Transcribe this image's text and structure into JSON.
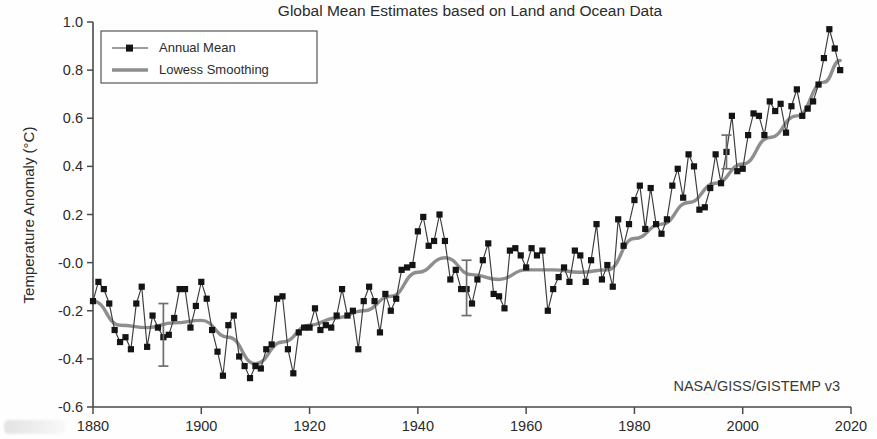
{
  "chart_data": {
    "type": "line",
    "title": "Global Mean Estimates based on Land and Ocean Data",
    "xlabel": "",
    "ylabel": "Temperature Anomaly (°C)",
    "xlim": [
      1880,
      2020
    ],
    "ylim": [
      -0.6,
      1.0
    ],
    "xticks": [
      "1880",
      "1900",
      "1920",
      "1940",
      "1960",
      "1980",
      "2000",
      "2020"
    ],
    "yticks": [
      "1.0",
      "0.8",
      "0.6",
      "0.4",
      "0.2",
      "-0.0",
      "-0.2",
      "-0.4",
      "-0.6"
    ],
    "grid": false,
    "legend_position": "top-left",
    "annotation": "NASA/GISS/GISTEMP v3",
    "series": [
      {
        "name": "Annual Mean",
        "marker": "square",
        "color": "#141414",
        "x": [
          1880,
          1881,
          1882,
          1883,
          1884,
          1885,
          1886,
          1887,
          1888,
          1889,
          1890,
          1891,
          1892,
          1893,
          1894,
          1895,
          1896,
          1897,
          1898,
          1899,
          1900,
          1901,
          1902,
          1903,
          1904,
          1905,
          1906,
          1907,
          1908,
          1909,
          1910,
          1911,
          1912,
          1913,
          1914,
          1915,
          1916,
          1917,
          1918,
          1919,
          1920,
          1921,
          1922,
          1923,
          1924,
          1925,
          1926,
          1927,
          1928,
          1929,
          1930,
          1931,
          1932,
          1933,
          1934,
          1935,
          1936,
          1937,
          1938,
          1939,
          1940,
          1941,
          1942,
          1943,
          1944,
          1945,
          1946,
          1947,
          1948,
          1949,
          1950,
          1951,
          1952,
          1953,
          1954,
          1955,
          1956,
          1957,
          1958,
          1959,
          1960,
          1961,
          1962,
          1963,
          1964,
          1965,
          1966,
          1967,
          1968,
          1969,
          1970,
          1971,
          1972,
          1973,
          1974,
          1975,
          1976,
          1977,
          1978,
          1979,
          1980,
          1981,
          1982,
          1983,
          1984,
          1985,
          1986,
          1987,
          1988,
          1989,
          1990,
          1991,
          1992,
          1993,
          1994,
          1995,
          1996,
          1997,
          1998,
          1999,
          2000,
          2001,
          2002,
          2003,
          2004,
          2005,
          2006,
          2007,
          2008,
          2009,
          2010,
          2011,
          2012,
          2013,
          2014,
          2015,
          2016,
          2017,
          2018
        ],
        "values": [
          -0.16,
          -0.08,
          -0.11,
          -0.17,
          -0.28,
          -0.33,
          -0.31,
          -0.36,
          -0.17,
          -0.1,
          -0.35,
          -0.22,
          -0.27,
          -0.31,
          -0.3,
          -0.23,
          -0.11,
          -0.11,
          -0.27,
          -0.18,
          -0.08,
          -0.15,
          -0.28,
          -0.37,
          -0.47,
          -0.26,
          -0.22,
          -0.39,
          -0.43,
          -0.48,
          -0.43,
          -0.44,
          -0.36,
          -0.34,
          -0.15,
          -0.14,
          -0.36,
          -0.46,
          -0.29,
          -0.27,
          -0.27,
          -0.19,
          -0.28,
          -0.26,
          -0.27,
          -0.22,
          -0.11,
          -0.22,
          -0.2,
          -0.36,
          -0.16,
          -0.1,
          -0.16,
          -0.29,
          -0.13,
          -0.2,
          -0.15,
          -0.03,
          -0.02,
          -0.01,
          0.13,
          0.19,
          0.07,
          0.09,
          0.2,
          0.09,
          -0.07,
          -0.03,
          -0.11,
          -0.11,
          -0.17,
          -0.07,
          0.01,
          0.08,
          -0.13,
          -0.14,
          -0.19,
          0.05,
          0.06,
          0.03,
          -0.02,
          0.06,
          0.03,
          0.05,
          -0.2,
          -0.11,
          -0.06,
          -0.02,
          -0.08,
          0.05,
          0.03,
          -0.08,
          0.01,
          0.16,
          -0.07,
          -0.01,
          -0.1,
          0.18,
          0.07,
          0.16,
          0.26,
          0.32,
          0.14,
          0.31,
          0.16,
          0.12,
          0.18,
          0.32,
          0.39,
          0.27,
          0.45,
          0.4,
          0.22,
          0.23,
          0.31,
          0.45,
          0.33,
          0.46,
          0.61,
          0.38,
          0.39,
          0.53,
          0.62,
          0.61,
          0.53,
          0.67,
          0.63,
          0.66,
          0.54,
          0.65,
          0.72,
          0.61,
          0.64,
          0.67,
          0.74,
          0.85,
          0.97,
          0.89,
          0.8
        ]
      },
      {
        "name": "Lowess Smoothing",
        "marker": "none",
        "color": "#8e8e8e",
        "x": [
          1880,
          1885,
          1890,
          1895,
          1900,
          1905,
          1910,
          1915,
          1920,
          1925,
          1930,
          1935,
          1940,
          1945,
          1950,
          1955,
          1960,
          1965,
          1970,
          1975,
          1980,
          1985,
          1990,
          1995,
          2000,
          2005,
          2010,
          2015,
          2018
        ],
        "values": [
          -0.16,
          -0.26,
          -0.27,
          -0.25,
          -0.24,
          -0.31,
          -0.42,
          -0.33,
          -0.26,
          -0.23,
          -0.2,
          -0.14,
          -0.04,
          0.02,
          -0.05,
          -0.07,
          -0.03,
          -0.03,
          -0.04,
          -0.03,
          0.1,
          0.16,
          0.25,
          0.33,
          0.41,
          0.52,
          0.61,
          0.75,
          0.84
        ]
      }
    ],
    "error_bars": [
      {
        "x": 1893,
        "y": -0.31,
        "low": -0.43,
        "high": -0.17
      },
      {
        "x": 1949,
        "y": -0.11,
        "low": -0.22,
        "high": 0.01
      },
      {
        "x": 1997,
        "y": 0.46,
        "low": 0.39,
        "high": 0.53
      }
    ]
  }
}
